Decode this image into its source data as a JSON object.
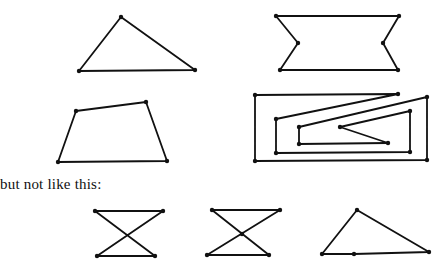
{
  "caption": "but not like this:",
  "stroke_color": "#111111",
  "good_figures": [
    {
      "name": "triangle",
      "points": [
        [
          121,
          17
        ],
        [
          195,
          70
        ],
        [
          79,
          71
        ]
      ],
      "dots": [
        [
          121,
          17
        ],
        [
          195,
          70
        ],
        [
          79,
          71
        ]
      ]
    },
    {
      "name": "notched-hexagon",
      "points": [
        [
          276,
          16
        ],
        [
          399,
          16
        ],
        [
          383,
          43
        ],
        [
          398,
          70
        ],
        [
          280,
          70
        ],
        [
          298,
          43
        ]
      ],
      "dots": [
        [
          276,
          16
        ],
        [
          399,
          16
        ],
        [
          383,
          43
        ],
        [
          398,
          70
        ],
        [
          280,
          70
        ],
        [
          298,
          43
        ]
      ]
    },
    {
      "name": "quadrilateral",
      "points": [
        [
          76,
          111
        ],
        [
          146,
          102
        ],
        [
          167,
          161
        ],
        [
          58,
          162
        ]
      ],
      "dots": [
        [
          76,
          111
        ],
        [
          146,
          102
        ],
        [
          167,
          161
        ],
        [
          58,
          162
        ]
      ]
    },
    {
      "name": "spiral-polygon",
      "points": [
        [
          255,
          95
        ],
        [
          398,
          94
        ],
        [
          276,
          119
        ],
        [
          276,
          153
        ],
        [
          410,
          152
        ],
        [
          410,
          111
        ],
        [
          340,
          127
        ],
        [
          388,
          143
        ],
        [
          299,
          144
        ],
        [
          299,
          127
        ],
        [
          427,
          97
        ],
        [
          427,
          160
        ],
        [
          255,
          161
        ]
      ],
      "dots": [
        [
          255,
          95
        ],
        [
          398,
          94
        ],
        [
          276,
          119
        ],
        [
          276,
          153
        ],
        [
          410,
          152
        ],
        [
          410,
          111
        ],
        [
          340,
          127
        ],
        [
          388,
          143
        ],
        [
          299,
          144
        ],
        [
          299,
          127
        ],
        [
          427,
          97
        ],
        [
          427,
          160
        ],
        [
          255,
          161
        ]
      ]
    }
  ],
  "bad_figures": [
    {
      "name": "bowtie-a",
      "points": [
        [
          95,
          211
        ],
        [
          163,
          211
        ],
        [
          97,
          256
        ],
        [
          155,
          256
        ]
      ],
      "dots": [
        [
          95,
          211
        ],
        [
          163,
          211
        ],
        [
          97,
          256
        ],
        [
          155,
          256
        ]
      ]
    },
    {
      "name": "bowtie-b",
      "points": [
        [
          212,
          210
        ],
        [
          280,
          210
        ],
        [
          207,
          255
        ],
        [
          269,
          255
        ]
      ],
      "dots": [
        [
          212,
          210
        ],
        [
          280,
          210
        ],
        [
          207,
          255
        ],
        [
          269,
          255
        ],
        [
          242,
          234
        ]
      ]
    },
    {
      "name": "degenerate-triangle",
      "points": [
        [
          357,
          210
        ],
        [
          429,
          252
        ],
        [
          354,
          254
        ],
        [
          322,
          254
        ]
      ],
      "dots": [
        [
          357,
          210
        ],
        [
          429,
          252
        ],
        [
          354,
          254
        ],
        [
          322,
          254
        ]
      ]
    }
  ]
}
